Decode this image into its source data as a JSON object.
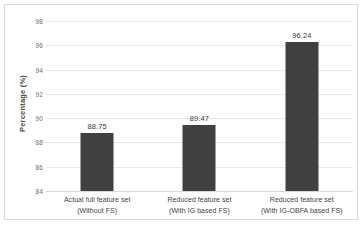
{
  "chart_data": {
    "type": "bar",
    "title": "",
    "xlabel": "",
    "ylabel": "Percentage (%)",
    "ylim": [
      84,
      98
    ],
    "yticks": [
      84,
      86,
      88,
      90,
      92,
      94,
      96,
      98
    ],
    "ytick_labels": [
      "84",
      "86",
      "88",
      "90",
      "92",
      "94",
      "96",
      "98"
    ],
    "grid": true,
    "legend": "none",
    "bar_color": "#404040",
    "categories": [
      "Actual full feature set (Without FS)",
      "Reduced feature set (With IG based FS)",
      "Reduced feature set (With IG-OBFA based FS)"
    ],
    "category_lines": [
      {
        "line1": "Actual full feature set",
        "line2": "(Without FS)"
      },
      {
        "line1": "Reduced feature set",
        "line2": "(With IG based FS)"
      },
      {
        "line1": "Reduced feature set",
        "line2": "(With IG-OBFA based FS)"
      }
    ],
    "values": [
      88.75,
      89.47,
      96.24
    ],
    "value_labels": [
      "88.75",
      "89.47",
      "96.24"
    ]
  }
}
